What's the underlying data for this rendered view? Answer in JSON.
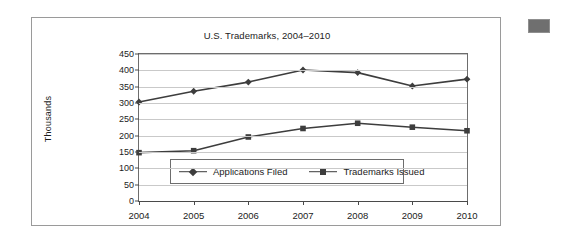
{
  "figure": {
    "title": "U.S. Trademarks, 2004–2010",
    "ylabel": "Thousands"
  },
  "swatch": {
    "name": "decorative-gray-block",
    "color": "#6f6f6f"
  },
  "chart_data": {
    "type": "line",
    "title": "U.S. Trademarks, 2004–2010",
    "xlabel": "",
    "ylabel": "Thousands",
    "categories": [
      "2004",
      "2005",
      "2006",
      "2007",
      "2008",
      "2009",
      "2010"
    ],
    "x": [
      2004,
      2005,
      2006,
      2007,
      2008,
      2009,
      2010
    ],
    "series": [
      {
        "name": "Applications Filed",
        "marker": "diamond",
        "color": "#3d3d3d",
        "values": [
          303,
          336,
          364,
          401,
          393,
          352,
          373
        ]
      },
      {
        "name": "Trademarks Issued",
        "marker": "square",
        "color": "#3d3d3d",
        "values": [
          148,
          154,
          196,
          222,
          238,
          226,
          215
        ]
      }
    ],
    "ylim": [
      0,
      450
    ],
    "yticks": [
      0,
      50,
      100,
      150,
      200,
      250,
      300,
      350,
      400,
      450
    ],
    "ytick_labels": [
      "0",
      "50",
      "100",
      "150",
      "200",
      "250",
      "300",
      "350",
      "400",
      "450"
    ],
    "grid": "horizontal",
    "legend_position": "inside-bottom-left"
  }
}
